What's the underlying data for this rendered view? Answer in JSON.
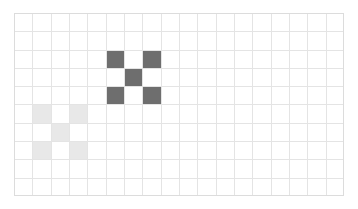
{
  "canvas": {
    "label": "pixel-grid-canvas",
    "columns": 18,
    "rows": 10,
    "cell_size_px": 18.33,
    "origin_x_px": 14,
    "origin_y_px": 13,
    "width_px": 330,
    "height_px": 183,
    "background_color": "#ffffff",
    "gridline_color": "#e4e4e4",
    "border_color": "#dcdcdc"
  },
  "palette": {
    "empty": "#ffffff",
    "dark_gray": "#6e6e6e",
    "light_gray": "#e8e8e8"
  },
  "shapes": [
    {
      "name": "dark-x-pattern",
      "color_key": "dark_gray",
      "color": "#6e6e6e",
      "origin_col": 5,
      "origin_row": 2,
      "cells": [
        [
          5,
          2
        ],
        [
          7,
          2
        ],
        [
          6,
          3
        ],
        [
          5,
          4
        ],
        [
          7,
          4
        ]
      ]
    },
    {
      "name": "light-x-pattern",
      "color_key": "light_gray",
      "color": "#e8e8e8",
      "origin_col": 1,
      "origin_row": 5,
      "cells": [
        [
          1,
          5
        ],
        [
          3,
          5
        ],
        [
          2,
          6
        ],
        [
          1,
          7
        ],
        [
          3,
          7
        ]
      ]
    }
  ],
  "filled_cells": [
    {
      "col": 5,
      "row": 2,
      "color": "#6e6e6e",
      "shape": "dark-x-pattern"
    },
    {
      "col": 7,
      "row": 2,
      "color": "#6e6e6e",
      "shape": "dark-x-pattern"
    },
    {
      "col": 6,
      "row": 3,
      "color": "#6e6e6e",
      "shape": "dark-x-pattern"
    },
    {
      "col": 5,
      "row": 4,
      "color": "#6e6e6e",
      "shape": "dark-x-pattern"
    },
    {
      "col": 7,
      "row": 4,
      "color": "#6e6e6e",
      "shape": "dark-x-pattern"
    },
    {
      "col": 1,
      "row": 5,
      "color": "#e8e8e8",
      "shape": "light-x-pattern"
    },
    {
      "col": 3,
      "row": 5,
      "color": "#e8e8e8",
      "shape": "light-x-pattern"
    },
    {
      "col": 2,
      "row": 6,
      "color": "#e8e8e8",
      "shape": "light-x-pattern"
    },
    {
      "col": 1,
      "row": 7,
      "color": "#e8e8e8",
      "shape": "light-x-pattern"
    },
    {
      "col": 3,
      "row": 7,
      "color": "#e8e8e8",
      "shape": "light-x-pattern"
    }
  ]
}
